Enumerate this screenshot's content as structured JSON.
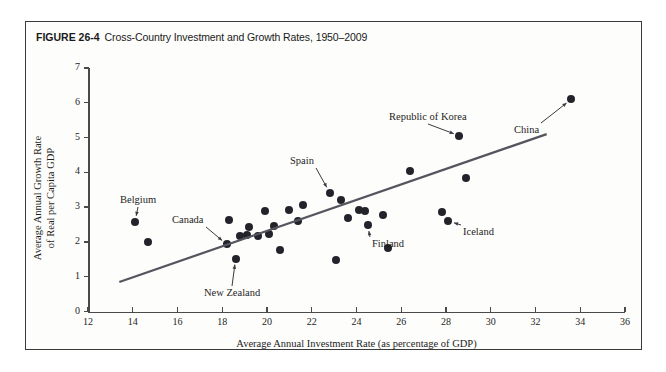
{
  "figure": {
    "number": "FIGURE 26-4",
    "caption": "Cross-Country Investment and Growth Rates, 1950–2009"
  },
  "chart_data": {
    "type": "scatter",
    "title": "Cross-Country Investment and Growth Rates, 1950–2009",
    "xlabel": "Average Annual Investment Rate (as percentage of GDP)",
    "ylabel": "Average Annual Growth Rate of Real per Capita GDP",
    "ylabel_line1": "Average Annual Growth Rate",
    "ylabel_line2": "of Real per Capita GDP",
    "xlim": [
      12,
      36
    ],
    "ylim": [
      0,
      7
    ],
    "xticks": [
      12,
      14,
      16,
      18,
      20,
      22,
      24,
      26,
      28,
      30,
      32,
      34,
      36
    ],
    "yticks": [
      0,
      1,
      2,
      3,
      4,
      5,
      6,
      7
    ],
    "grid": false,
    "legend": "none",
    "marker_color": "#23232b",
    "trendline_color": "#55555f",
    "trendline": {
      "label": "fitted regression line",
      "x_start": 13.4,
      "y_start": 0.85,
      "x_end": 32.5,
      "y_end": 5.1
    },
    "points": [
      {
        "x": 14.1,
        "y": 2.58,
        "label": "Belgium"
      },
      {
        "x": 14.7,
        "y": 2.0,
        "label": ""
      },
      {
        "x": 18.2,
        "y": 1.93,
        "label": "Canada"
      },
      {
        "x": 18.3,
        "y": 2.62,
        "label": ""
      },
      {
        "x": 18.6,
        "y": 1.52,
        "label": "New Zealand"
      },
      {
        "x": 18.8,
        "y": 2.17,
        "label": ""
      },
      {
        "x": 19.1,
        "y": 2.2,
        "label": ""
      },
      {
        "x": 19.2,
        "y": 2.42,
        "label": ""
      },
      {
        "x": 19.6,
        "y": 2.18,
        "label": ""
      },
      {
        "x": 19.9,
        "y": 2.9,
        "label": ""
      },
      {
        "x": 20.1,
        "y": 2.22,
        "label": ""
      },
      {
        "x": 20.3,
        "y": 2.45,
        "label": ""
      },
      {
        "x": 20.6,
        "y": 1.78,
        "label": ""
      },
      {
        "x": 21.0,
        "y": 2.92,
        "label": ""
      },
      {
        "x": 21.4,
        "y": 2.6,
        "label": ""
      },
      {
        "x": 21.6,
        "y": 3.05,
        "label": ""
      },
      {
        "x": 22.8,
        "y": 3.42,
        "label": "Spain"
      },
      {
        "x": 23.1,
        "y": 1.48,
        "label": ""
      },
      {
        "x": 23.3,
        "y": 3.2,
        "label": ""
      },
      {
        "x": 23.6,
        "y": 2.68,
        "label": ""
      },
      {
        "x": 24.1,
        "y": 2.92,
        "label": ""
      },
      {
        "x": 24.4,
        "y": 2.9,
        "label": ""
      },
      {
        "x": 24.5,
        "y": 2.48,
        "label": "Finland"
      },
      {
        "x": 25.2,
        "y": 2.78,
        "label": ""
      },
      {
        "x": 25.4,
        "y": 1.82,
        "label": ""
      },
      {
        "x": 26.4,
        "y": 4.03,
        "label": ""
      },
      {
        "x": 27.8,
        "y": 2.85,
        "label": ""
      },
      {
        "x": 28.1,
        "y": 2.6,
        "label": "Iceland"
      },
      {
        "x": 28.6,
        "y": 5.05,
        "label": "Republic of Korea"
      },
      {
        "x": 28.9,
        "y": 3.85,
        "label": ""
      },
      {
        "x": 33.6,
        "y": 6.1,
        "label": "China"
      }
    ],
    "annotations": [
      {
        "text": "Belgium",
        "x_px": 120,
        "y_px": 194
      },
      {
        "text": "Canada",
        "x_px": 172,
        "y_px": 214
      },
      {
        "text": "New Zealand",
        "x_px": 204,
        "y_px": 287
      },
      {
        "text": "Spain",
        "x_px": 290,
        "y_px": 155
      },
      {
        "text": "Finland",
        "x_px": 372,
        "y_px": 238
      },
      {
        "text": "Iceland",
        "x_px": 463,
        "y_px": 226
      },
      {
        "text": "Republic of Korea",
        "x_px": 389,
        "y_px": 111
      },
      {
        "text": "China",
        "x_px": 514,
        "y_px": 124
      }
    ]
  }
}
